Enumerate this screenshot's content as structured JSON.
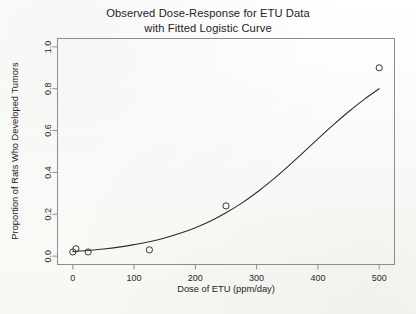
{
  "figure": {
    "title_line1": "Observed Dose-Response for ETU Data",
    "title_line2": "with Fitted Logistic Curve",
    "background_color": "#fbfbf9",
    "frame_color": "#8d8d8d",
    "curve_color": "#2b2b2b",
    "point_color": "#3a3a3a"
  },
  "chart_data": {
    "type": "scatter",
    "title": "Observed Dose-Response for ETU Data with Fitted Logistic Curve",
    "xlabel": "Dose of ETU (ppm/day)",
    "ylabel": "Proportion of Rats Who Developed Tumors",
    "xlim": [
      -25,
      525
    ],
    "ylim": [
      -0.04,
      1.04
    ],
    "xticks": [
      0,
      100,
      200,
      300,
      400,
      500
    ],
    "xtick_labels": [
      "0",
      "100",
      "200",
      "300",
      "400",
      "500"
    ],
    "yticks": [
      0.0,
      0.2,
      0.4,
      0.6,
      0.8,
      1.0
    ],
    "ytick_labels": [
      "0.0",
      "0.2",
      "0.4",
      "0.6",
      "0.8",
      "1.0"
    ],
    "grid": false,
    "legend": false,
    "series": [
      {
        "name": "Observed proportions",
        "marker": "open-circle",
        "x": [
          0,
          5,
          25,
          125,
          250,
          500
        ],
        "y": [
          0.02,
          0.035,
          0.02,
          0.03,
          0.24,
          0.9
        ]
      },
      {
        "name": "Fitted logistic curve",
        "marker": "line",
        "x": [
          0,
          25,
          50,
          75,
          100,
          125,
          150,
          175,
          200,
          225,
          250,
          275,
          300,
          325,
          350,
          375,
          400,
          425,
          450,
          475,
          500
        ],
        "y": [
          0.022,
          0.027,
          0.034,
          0.043,
          0.055,
          0.069,
          0.087,
          0.109,
          0.136,
          0.168,
          0.207,
          0.252,
          0.304,
          0.362,
          0.425,
          0.492,
          0.56,
          0.627,
          0.69,
          0.748,
          0.8
        ]
      }
    ]
  }
}
